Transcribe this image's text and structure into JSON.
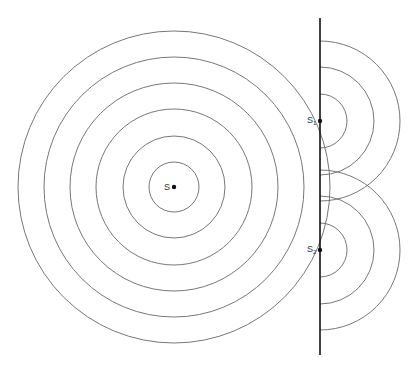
{
  "diagram": {
    "type": "double-slit wave diffraction",
    "source": {
      "label": "S",
      "x": 174,
      "y": 187,
      "radii": [
        25,
        51,
        78,
        104,
        130,
        156
      ]
    },
    "barrier": {
      "x": 320,
      "y1": 18,
      "y2": 355
    },
    "slits": [
      {
        "label": "S",
        "subscript": "1",
        "x": 320,
        "y": 121,
        "radii": [
          27,
          54,
          80
        ]
      },
      {
        "label": "S",
        "subscript": "2",
        "x": 320,
        "y": 250,
        "radii": [
          27,
          54,
          80
        ]
      }
    ],
    "colors": {
      "wave": "#777777",
      "barrier": "#111111",
      "dot": "#111111"
    }
  }
}
